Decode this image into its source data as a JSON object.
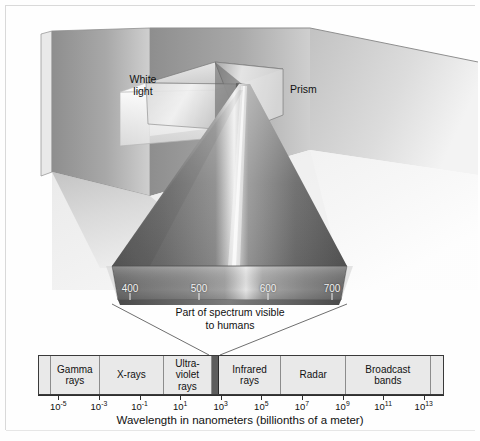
{
  "figure": {
    "title_visible": false,
    "background_color": "#fefefe",
    "border_color": "#d9d9d9"
  },
  "scene": {
    "white_light_label": "White\nlight",
    "white_light_line1": "White",
    "white_light_line2": "light",
    "prism_label": "Prism",
    "visible_caption_line1": "Part of spectrum visible",
    "visible_caption_line2": "to humans",
    "wall_color": "#9a9a9a",
    "floor_color": "#c9c9c9",
    "beam_color": "#6e6e6e"
  },
  "visible_spectrum": {
    "unit": "nm",
    "range": [
      380,
      720
    ],
    "tick_values": [
      400,
      500,
      600,
      700
    ],
    "tick_labels": [
      "400",
      "500",
      "600",
      "700"
    ]
  },
  "chart_data": {
    "type": "bar",
    "xlabel": "Wavelength in nanometers (billionths of a meter)",
    "ylabel": "",
    "xscale": "log10",
    "xlim": [
      -6,
      14
    ],
    "grid": false,
    "legend": "none",
    "axis_title": "Wavelength in nanometers (billionths of a meter)",
    "tick_exponents": [
      -5,
      -3,
      -1,
      1,
      3,
      5,
      7,
      9,
      11,
      13
    ],
    "tick_labels": [
      "10⁻⁵",
      "10⁻³",
      "10⁻¹",
      "10¹",
      "10³",
      "10⁵",
      "10⁷",
      "10⁹",
      "10¹¹",
      "10¹³"
    ],
    "tick_mantissa": "10",
    "tick_superscripts": [
      "-5",
      "-3",
      "-1",
      "1",
      "3",
      "5",
      "7",
      "9",
      "11",
      "13"
    ],
    "bands": [
      {
        "label": "",
        "start_exp": -6.0,
        "end_exp": -5.4,
        "highlight": false
      },
      {
        "label": "Gamma\nrays",
        "label_line1": "Gamma",
        "label_line2": "rays",
        "start_exp": -5.4,
        "end_exp": -3.0,
        "highlight": false
      },
      {
        "label": "X-rays",
        "label_line1": "X-rays",
        "label_line2": "",
        "start_exp": -3.0,
        "end_exp": 0.2,
        "highlight": false
      },
      {
        "label": "Ultra-\nviolet\nrays",
        "label_line1": "Ultra-",
        "label_line2": "violet",
        "label_line3": "rays",
        "start_exp": 0.2,
        "end_exp": 2.55,
        "highlight": false
      },
      {
        "label": "",
        "start_exp": 2.55,
        "end_exp": 2.9,
        "highlight": true
      },
      {
        "label": "Infrared\nrays",
        "label_line1": "Infrared",
        "label_line2": "rays",
        "start_exp": 2.9,
        "end_exp": 6.0,
        "highlight": false
      },
      {
        "label": "Radar",
        "label_line1": "Radar",
        "label_line2": "",
        "start_exp": 6.0,
        "end_exp": 9.2,
        "highlight": false
      },
      {
        "label": "Broadcast\nbands",
        "label_line1": "Broadcast",
        "label_line2": "bands",
        "start_exp": 9.2,
        "end_exp": 13.4,
        "highlight": false
      },
      {
        "label": "",
        "start_exp": 13.4,
        "end_exp": 14.0,
        "highlight": false
      }
    ],
    "visible_band": {
      "start_exp": 2.55,
      "end_exp": 2.9,
      "color": "#5d5d5d"
    }
  }
}
